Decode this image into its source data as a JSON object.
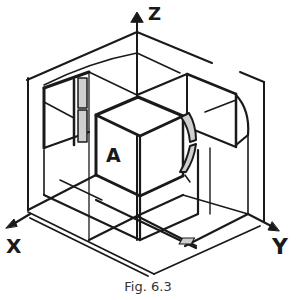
{
  "figure": {
    "caption": "Fig. 6.3",
    "axes": {
      "x": "X",
      "y": "Y",
      "z": "Z"
    },
    "cube_label": "A",
    "colors": {
      "ink": "#1a1a1a",
      "fill_grey": "#cfcfcf",
      "background": "#ffffff"
    }
  }
}
